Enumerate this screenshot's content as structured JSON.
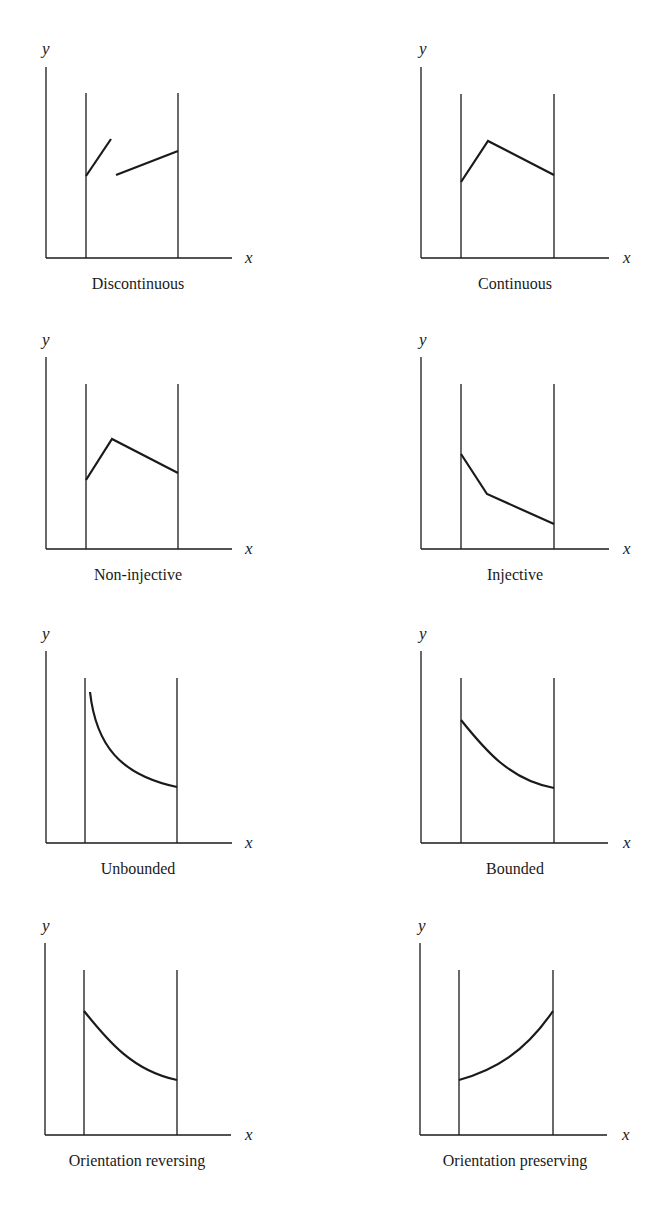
{
  "figure": {
    "axis_labels": {
      "x": "x",
      "y": "y"
    },
    "panels": [
      {
        "caption": "Discontinuous",
        "column": "left",
        "row": 1
      },
      {
        "caption": "Continuous",
        "column": "right",
        "row": 1
      },
      {
        "caption": "Non-injective",
        "column": "left",
        "row": 2
      },
      {
        "caption": "Injective",
        "column": "right",
        "row": 2
      },
      {
        "caption": "Unbounded",
        "column": "left",
        "row": 3
      },
      {
        "caption": "Bounded",
        "column": "right",
        "row": 3
      },
      {
        "caption": "Orientation reversing",
        "column": "left",
        "row": 4
      },
      {
        "caption": "Orientation preserving",
        "column": "right",
        "row": 4
      }
    ]
  }
}
